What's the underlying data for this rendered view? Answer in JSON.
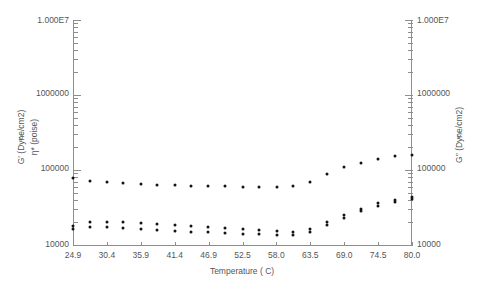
{
  "axes": {
    "x_title": "Temperature ( C)",
    "y_left_title_1": "G' (Dyne/cm^2)",
    "y_left_title_2": "η* (poise)",
    "y_right_title": "G'' (Dyne/cm^2)",
    "x_ticks": [
      "24.9",
      "30.4",
      "35.9",
      "41.4",
      "46.9",
      "52.5",
      "58.0",
      "63.5",
      "69.0",
      "74.5",
      "80.0"
    ],
    "y_left_ticks": [
      "1.000E7",
      "1000000",
      "100000",
      "10000"
    ],
    "y_right_ticks": [
      "1.000E7",
      "1000000",
      "100000",
      "10000"
    ]
  },
  "colors": {
    "marker": "#141414",
    "axis": "#8d8d8d",
    "text": "#555555",
    "background": "#ffffff"
  },
  "chart_data": {
    "type": "scatter",
    "title": "",
    "xlabel": "Temperature ( C)",
    "ylabel": "G' (Dyne/cm^2) / η* (poise)",
    "y2label": "G'' (Dyne/cm^2)",
    "xlim": [
      24.9,
      80.0
    ],
    "ylim": [
      10000,
      10000000
    ],
    "yscale": "log",
    "grid": false,
    "legend": "none",
    "x": [
      24.9,
      27.6,
      30.4,
      33.1,
      35.9,
      38.6,
      41.4,
      44.1,
      46.9,
      49.6,
      52.5,
      55.2,
      58.0,
      60.7,
      63.5,
      66.2,
      69.0,
      71.7,
      74.5,
      77.2,
      80.0
    ],
    "series": [
      {
        "name": "eta*",
        "axis": "left",
        "values": [
          78000,
          71000,
          69000,
          67000,
          66000,
          64000,
          63000,
          62000,
          62000,
          61000,
          60000,
          59000,
          59000,
          62000,
          70000,
          88000,
          108000,
          125000,
          140000,
          152000,
          160000
        ]
      },
      {
        "name": "G'",
        "axis": "left",
        "values": [
          18000,
          20000,
          20000,
          20500,
          19500,
          19000,
          18500,
          18000,
          17500,
          17000,
          16500,
          16000,
          15500,
          15000,
          16500,
          20000,
          25000,
          30000,
          36000,
          40000,
          44000
        ]
      },
      {
        "name": "G''",
        "axis": "right",
        "values": [
          16500,
          17500,
          17500,
          17000,
          16500,
          16000,
          15500,
          15000,
          14800,
          14500,
          14200,
          14000,
          13800,
          13500,
          15000,
          18500,
          23000,
          28000,
          33000,
          37000,
          41000
        ]
      }
    ]
  }
}
